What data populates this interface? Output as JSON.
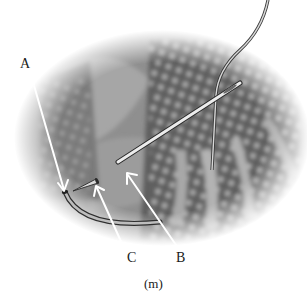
{
  "figure": {
    "labels": [
      {
        "id": "A",
        "text": "A"
      },
      {
        "id": "B",
        "text": "B"
      },
      {
        "id": "C",
        "text": "C"
      }
    ],
    "caption": "(m)",
    "colors": {
      "background": "#ffffff",
      "fabric": "#8a8a8a",
      "fabric_dark": "#5e5e5e",
      "dots": "#c8c8c8",
      "arrow": "#ffffff",
      "needle": "#e6e6e6",
      "needle_outline": "#2a2a2a",
      "text": "#1a1a1a"
    }
  }
}
